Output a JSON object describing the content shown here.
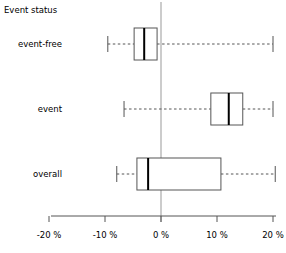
{
  "chart_data": {
    "type": "boxplot",
    "title": "Event status",
    "orientation": "horizontal",
    "xlabel": "",
    "ylabel": "",
    "xlim": [
      -20,
      20
    ],
    "xtick_values": [
      -20,
      -10,
      0,
      10,
      20
    ],
    "xtick_labels": [
      "-20 %",
      "-10 %",
      "0 %",
      "10 %",
      "20 %"
    ],
    "categories": [
      "event-free",
      "event",
      "overall"
    ],
    "grid": false,
    "reference_line": {
      "value": 0,
      "label": "0 %",
      "color": "#999999"
    },
    "box_color": "#ffffff",
    "line_color": "#555555",
    "median_color": "#000000",
    "whisker_style": "dashed",
    "boxes": [
      {
        "category": "event-free",
        "whisker_low": -9.5,
        "q1": -4.8,
        "median": -3.0,
        "q3": -0.7,
        "whisker_high": 20.0
      },
      {
        "category": "event",
        "whisker_low": -6.6,
        "q1": 8.9,
        "median": 12.1,
        "q3": 14.6,
        "whisker_high": 20.0
      },
      {
        "category": "overall",
        "whisker_low": -7.9,
        "q1": -4.3,
        "median": -2.3,
        "q3": 10.7,
        "whisker_high": 20.4
      }
    ]
  }
}
